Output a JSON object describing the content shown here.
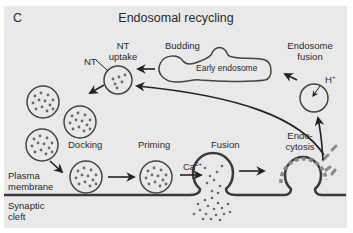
{
  "figure": {
    "panel_letter": "C",
    "title": "Endosomal recycling",
    "colors": {
      "background": "#e9e9e9",
      "membrane": "#3a3a3a",
      "vesicle_stroke": "#444444",
      "neurotransmitter_dots": "#6a6a6a",
      "clathrin_coat": "#8a8a8a"
    }
  },
  "labels": {
    "nt": "NT",
    "nt_uptake_line1": "NT",
    "nt_uptake_line2": "uptake",
    "budding": "Budding",
    "early_endosome": "Early endosome",
    "endosome_fusion_line1": "Endosome",
    "endosome_fusion_line2": "fusion",
    "proton": "H",
    "proton_charge": "+",
    "docking": "Docking",
    "priming": "Priming",
    "calcium": "Ca",
    "calcium_charge": "2+",
    "fusion": "Fusion",
    "endocytosis_line1": "Endo-",
    "endocytosis_line2": "cytosis",
    "plasma_membrane_line1": "Plasma",
    "plasma_membrane_line2": "membrane",
    "synaptic_cleft_line1": "Synaptic",
    "synaptic_cleft_line2": "cleft"
  },
  "stages": [
    "Endocytosis",
    "Endosome fusion",
    "Budding",
    "NT uptake",
    "Docking",
    "Priming",
    "Fusion"
  ]
}
